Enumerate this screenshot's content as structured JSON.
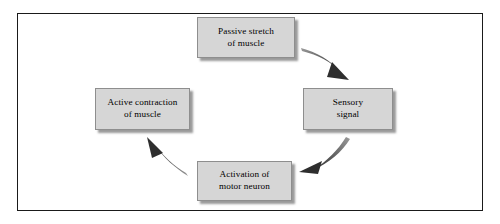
{
  "figure": {
    "background_color": "#ffffff",
    "frame_color": "#1a1a1a",
    "node_fill_color": "#d6d6d6",
    "node_border_color": "#8e8e8e",
    "arrow_color": "#3a3a3a",
    "text_color": "#000000"
  },
  "nodes": [
    {
      "id": "passive-stretch",
      "label": "Passive stretch\nof muscle",
      "line1": "Passive stretch",
      "line2": "of muscle",
      "position": "top"
    },
    {
      "id": "sensory-signal",
      "label": "Sensory\nsignal",
      "line1": "Sensory",
      "line2": "signal",
      "position": "right"
    },
    {
      "id": "activation-motor-neuron",
      "label": "Activation of\nmotor neuron",
      "line1": "Activation of",
      "line2": "motor neuron",
      "position": "bottom"
    },
    {
      "id": "active-contraction",
      "label": "Active contraction\nof muscle",
      "line1": "Active contraction",
      "line2": "of muscle",
      "position": "left"
    }
  ],
  "arrows": [
    {
      "id": "arrow-stretch-to-sensory",
      "from": "passive-stretch",
      "to": "sensory-signal",
      "direction": "down-right"
    },
    {
      "id": "arrow-sensory-to-activation",
      "from": "sensory-signal",
      "to": "activation-motor-neuron",
      "direction": "down-left"
    },
    {
      "id": "arrow-activation-to-contraction",
      "from": "activation-motor-neuron",
      "to": "active-contraction",
      "direction": "up-left"
    }
  ]
}
